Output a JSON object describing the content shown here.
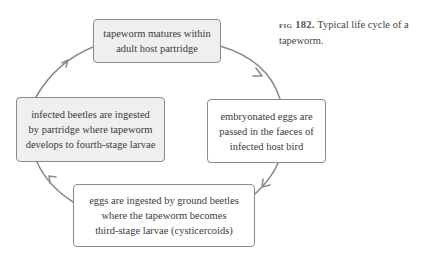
{
  "figure": {
    "label": "fig 182.",
    "caption": " Typical life cycle of a tapeworm."
  },
  "diagram": {
    "type": "cycle",
    "arrow_color": "#8c8c8c",
    "grey_fill": "#efefef",
    "stages": [
      {
        "id": "adult-in-partridge",
        "fill": "grey",
        "lines": [
          "tapeworm matures within",
          "adult host partridge"
        ]
      },
      {
        "id": "eggs-in-faeces",
        "fill": "white",
        "lines": [
          "embryonated eggs are",
          "passed in the faeces of",
          "infected host bird"
        ]
      },
      {
        "id": "eggs-ingested-by-beetles",
        "fill": "white",
        "lines": [
          "eggs are ingested by ground beetles",
          "where the tapeworm becomes",
          "third-stage larvae (cysticercoids)"
        ]
      },
      {
        "id": "beetles-ingested-by-partridge",
        "fill": "grey",
        "lines": [
          "infected beetles are ingested",
          "by partridge where tapeworm",
          "develops to fourth-stage larvae"
        ]
      }
    ],
    "flow": [
      "adult-in-partridge -> eggs-in-faeces",
      "eggs-in-faeces -> eggs-ingested-by-beetles",
      "eggs-ingested-by-beetles -> beetles-ingested-by-partridge",
      "beetles-ingested-by-partridge -> adult-in-partridge"
    ]
  }
}
